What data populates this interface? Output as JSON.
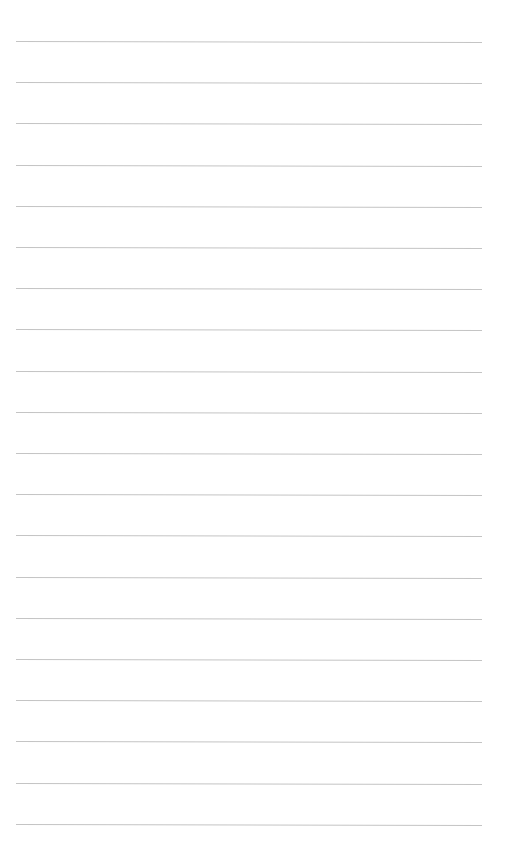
{
  "page": {
    "type": "lined-paper",
    "background_color": "#ffffff",
    "line_color": "#c4c4c4",
    "line_count": 20,
    "first_line_y": 41,
    "line_spacing": 41.2,
    "line_left": 16,
    "line_right": 482,
    "text": ""
  }
}
